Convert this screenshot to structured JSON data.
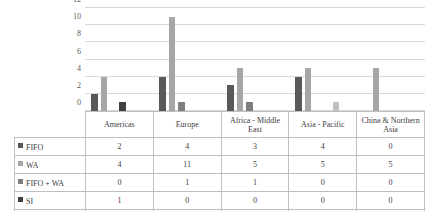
{
  "chart_data": {
    "type": "bar",
    "title": "",
    "subtitle": "",
    "xlabel": "",
    "ylabel": "",
    "ylim": [
      0,
      12
    ],
    "yticks": [
      0,
      2,
      4,
      6,
      8,
      10,
      12
    ],
    "grid": true,
    "legend_position": "table-left",
    "categories": [
      "Americas",
      "Europe",
      "Africa - Middle East",
      "Asia - Pacific",
      "China & Northern Asia"
    ],
    "series": [
      {
        "name": "FIFO",
        "values": [
          2,
          4,
          3,
          4,
          0
        ],
        "color": "#595959"
      },
      {
        "name": "WA",
        "values": [
          4,
          11,
          5,
          5,
          5
        ],
        "color": "#a6a6a6"
      },
      {
        "name": "FIFO + WA",
        "values": [
          0,
          1,
          1,
          0,
          0
        ],
        "color": "#7f7f7f"
      },
      {
        "name": "SI",
        "values": [
          1,
          0,
          0,
          0,
          0
        ],
        "color": "#404040"
      },
      {
        "name": "FIFO + WA + SI",
        "values": [
          0,
          0,
          0,
          1,
          0
        ],
        "color": "#bfbfbf"
      }
    ]
  },
  "table": {
    "headers": [
      "",
      "Americas",
      "Europe",
      "Africa - Middle East",
      "Asia - Pacific",
      "China & Northern Asia"
    ],
    "rows": [
      {
        "label": "FIFO",
        "swatch": "#595959",
        "values": [
          "2",
          "4",
          "3",
          "4",
          "0"
        ]
      },
      {
        "label": "WA",
        "swatch": "#a6a6a6",
        "values": [
          "4",
          "11",
          "5",
          "5",
          "5"
        ]
      },
      {
        "label": "FIFO + WA",
        "swatch": "#7f7f7f",
        "values": [
          "0",
          "1",
          "1",
          "0",
          "0"
        ]
      },
      {
        "label": "SI",
        "swatch": "#404040",
        "values": [
          "1",
          "0",
          "0",
          "0",
          "0"
        ]
      },
      {
        "label": "FIFO + WA + SI",
        "swatch": "#bfbfbf",
        "values": [
          "0",
          "0",
          "0",
          "1",
          "0"
        ]
      }
    ]
  },
  "axis": {
    "ticks": [
      "12",
      "10",
      "8",
      "6",
      "4",
      "2",
      "0"
    ]
  },
  "colors": {
    "gridline": "#d9d9d9",
    "border": "#bfbfbf",
    "text": "#404040"
  }
}
